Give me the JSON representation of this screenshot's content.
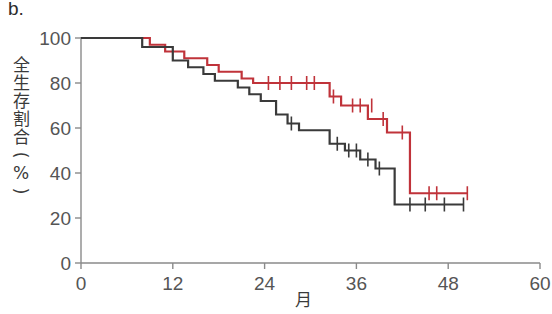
{
  "panel": {
    "label": "b."
  },
  "axes": {
    "x_label": "月",
    "y_label_chars": [
      "全",
      "生",
      "存",
      "割",
      "合",
      "(",
      "%",
      ")"
    ],
    "x_ticks": [
      "0",
      "12",
      "24",
      "36",
      "48",
      "60"
    ],
    "y_ticks": [
      "0",
      "20",
      "40",
      "60",
      "80",
      "100"
    ]
  },
  "colors": {
    "series_red": "#c0333a",
    "series_black": "#3a3a3a",
    "axis": "#8a8a8a",
    "tick_text": "#555555"
  },
  "chart_data": {
    "type": "line",
    "title": "",
    "subtitle": "",
    "xlabel": "月",
    "ylabel": "全生存割合(%)",
    "xlim": [
      0,
      60
    ],
    "ylim": [
      0,
      100
    ],
    "xticks": [
      0,
      12,
      24,
      36,
      48,
      60
    ],
    "yticks": [
      0,
      20,
      40,
      60,
      80,
      100
    ],
    "grid": false,
    "legend": "none",
    "step_type": "post",
    "annotations": "Kaplan-Meier overall survival curves; vertical tick marks denote censored observations.",
    "series": [
      {
        "name": "red-curve",
        "color": "#c0333a",
        "x": [
          0,
          9.0,
          9.0,
          11.0,
          11.0,
          13.5,
          13.5,
          16.5,
          16.5,
          18.0,
          18.0,
          19.5,
          19.5,
          21.0,
          21.0,
          22.5,
          22.5,
          32.5,
          32.5,
          34.0,
          34.0,
          37.5,
          37.5,
          40.0,
          40.0,
          43.0,
          43.0,
          50.5
        ],
        "y": [
          100,
          100,
          97,
          97,
          94,
          94,
          91,
          91,
          88,
          88,
          85,
          85,
          85,
          85,
          82,
          82,
          80,
          80,
          74,
          74,
          70,
          70,
          64,
          64,
          58,
          58,
          31,
          31
        ],
        "censor_x": [
          24.5,
          26.0,
          27.5,
          29.5,
          30.5,
          33.0,
          35.5,
          36.5,
          38.0,
          39.5,
          42.0,
          45.5,
          46.5,
          50.5
        ],
        "censor_y": [
          80,
          80,
          80,
          80,
          80,
          74,
          70,
          70,
          70,
          64,
          58,
          31,
          31,
          31
        ]
      },
      {
        "name": "black-curve",
        "color": "#3a3a3a",
        "x": [
          0,
          8.0,
          8.0,
          12.0,
          12.0,
          14.0,
          14.0,
          16.0,
          16.0,
          17.5,
          17.5,
          19.0,
          19.0,
          20.5,
          20.5,
          22.0,
          22.0,
          23.5,
          23.5,
          25.5,
          25.5,
          27.0,
          27.0,
          28.5,
          28.5,
          30.5,
          30.5,
          32.5,
          32.5,
          34.5,
          34.5,
          36.5,
          36.5,
          38.5,
          38.5,
          41.0,
          41.0,
          50.0
        ],
        "y": [
          100,
          100,
          96,
          96,
          90,
          90,
          87,
          87,
          84,
          84,
          81,
          81,
          81,
          81,
          78,
          78,
          75,
          75,
          72,
          72,
          66,
          66,
          62,
          62,
          59,
          59,
          59,
          59,
          53,
          53,
          50,
          50,
          46,
          46,
          42,
          42,
          26,
          26
        ],
        "censor_x": [
          27.5,
          33.5,
          35.0,
          36.0,
          37.5,
          39.0,
          43.0,
          45.0,
          47.5,
          50.0
        ],
        "censor_y": [
          62,
          53,
          50,
          50,
          46,
          42,
          26,
          26,
          26,
          26
        ]
      }
    ]
  }
}
